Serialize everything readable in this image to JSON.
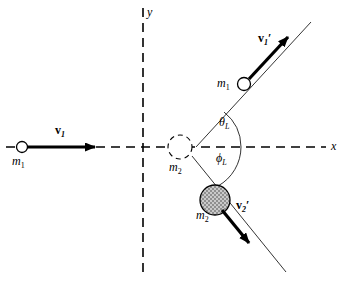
{
  "figure": {
    "kind": "scattering-diagram",
    "background_color": "#ffffff",
    "stroke_color": "#000000",
    "sphere_fill_color": "#b8b8b8"
  },
  "axes": {
    "x_label": "x",
    "y_label": "y",
    "style": "dashed"
  },
  "vectors": {
    "v1": {
      "symbol": "v",
      "subscript": "1",
      "prime": ""
    },
    "v1p": {
      "symbol": "v",
      "subscript": "1",
      "prime": "′"
    },
    "v2p": {
      "symbol": "v",
      "subscript": "2",
      "prime": "′"
    }
  },
  "particles": {
    "incoming": {
      "label_symbol": "m",
      "label_subscript": "1"
    },
    "target": {
      "label_symbol": "m",
      "label_subscript": "2"
    },
    "scattered": {
      "label_symbol": "m",
      "label_subscript": "1"
    },
    "recoil": {
      "label_symbol": "m",
      "label_subscript": "2"
    }
  },
  "angles": {
    "theta": {
      "symbol": "θ",
      "subscript": "L"
    },
    "phi": {
      "symbol": "ϕ",
      "subscript": "L"
    }
  }
}
